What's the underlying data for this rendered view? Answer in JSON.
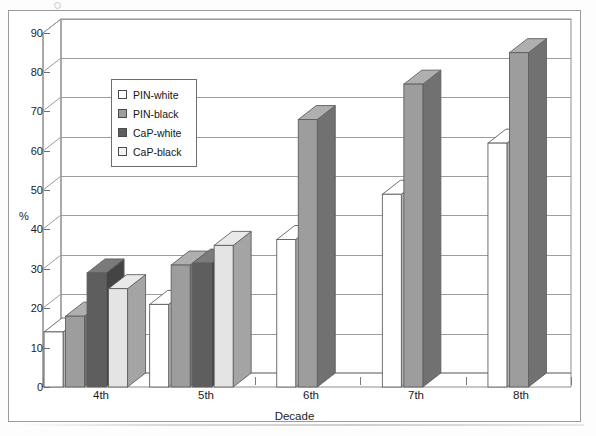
{
  "chart_data": {
    "type": "bar",
    "title": "",
    "subtitle": "",
    "xlabel": "Decade",
    "ylabel": "%",
    "categories": [
      "4th",
      "5th",
      "6th",
      "7th",
      "8th"
    ],
    "ylim": [
      0,
      90
    ],
    "yticks": [
      0,
      10,
      20,
      30,
      40,
      50,
      60,
      70,
      80,
      90
    ],
    "grid": true,
    "legend_position": "inside-upper-left",
    "projection": "3d",
    "series": [
      {
        "name": "PIN-white",
        "color": "#ffffff",
        "values": [
          14,
          21,
          37.5,
          49,
          62
        ]
      },
      {
        "name": "PIN-black",
        "color": "#9d9d9d",
        "values": [
          18,
          31,
          68,
          77,
          85
        ]
      },
      {
        "name": "CaP-white",
        "color": "#5e5e5e",
        "values": [
          29,
          31.5,
          null,
          null,
          null
        ]
      },
      {
        "name": "CaP-black",
        "color": "#e4e4e4",
        "values": [
          25,
          36,
          null,
          null,
          null
        ]
      }
    ]
  },
  "legend": {
    "entries": [
      {
        "label": "PIN-white"
      },
      {
        "label": "PIN-black"
      },
      {
        "label": "CaP-white"
      },
      {
        "label": "CaP-black"
      }
    ]
  },
  "axes": {
    "y_label": "%",
    "x_label": "Decade",
    "y_tick_labels": [
      "90",
      "80",
      "70",
      "60",
      "50",
      "40",
      "30",
      "20",
      "10",
      "0"
    ],
    "x_tick_labels": [
      "4th",
      "5th",
      "6th",
      "7th",
      "8th"
    ]
  },
  "colors": {
    "face_pin_white": "#ffffff",
    "face_pin_black": "#9d9d9d",
    "face_cap_white": "#5e5e5e",
    "face_cap_black": "#e4e4e4",
    "outline": "#5f5f5f",
    "gridline": "#9d9d9d",
    "frame": "#9a9a9a",
    "text": "#1c1c1c"
  }
}
